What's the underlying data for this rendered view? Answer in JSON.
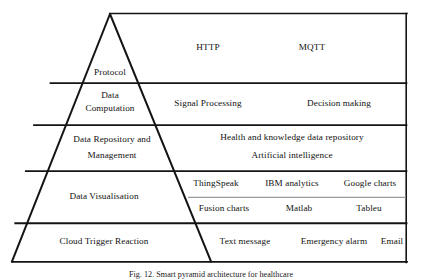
{
  "figure": {
    "caption": "Fig. 12. Smart pyramid architecture for healthcare",
    "colors": {
      "stroke": "#141414",
      "faint_divider": "#8d8d8d",
      "background": "#ffffff",
      "text": "#111111"
    },
    "layers": [
      {
        "id": "protocol",
        "stage": "Protocol",
        "stage_lines": [
          "Protocol"
        ],
        "technologies": [
          "HTTP",
          "MQTT"
        ],
        "tech_rows": [
          [
            "HTTP",
            "MQTT"
          ]
        ]
      },
      {
        "id": "data-computation",
        "stage": "Data Computation",
        "stage_lines": [
          "Data",
          "Computation"
        ],
        "technologies": [
          "Signal Processing",
          "Decision making"
        ],
        "tech_rows": [
          [
            "Signal Processing",
            "Decision making"
          ]
        ]
      },
      {
        "id": "data-repository-and-management",
        "stage": "Data Repository and Management",
        "stage_lines": [
          "Data Repository and",
          "Management"
        ],
        "technologies": [
          "Health and knowledge data repository",
          "Artificial intelligence"
        ],
        "tech_rows": [
          [
            "Health and knowledge data repository"
          ],
          [
            "Artificial intelligence"
          ]
        ]
      },
      {
        "id": "data-visualisation",
        "stage": "Data Visualisation",
        "stage_lines": [
          "Data Visualisation"
        ],
        "technologies": [
          "ThingSpeak",
          "IBM analytics",
          "Google charts",
          "Fusion charts",
          "Matlab",
          "Tableu"
        ],
        "tech_rows": [
          [
            "ThingSpeak",
            "IBM analytics",
            "Google charts"
          ],
          [
            "Fusion charts",
            "Matlab",
            "Tableu"
          ]
        ]
      },
      {
        "id": "cloud-trigger-reaction",
        "stage": "Cloud Trigger Reaction",
        "stage_lines": [
          "Cloud Trigger Reaction"
        ],
        "technologies": [
          "Text message",
          "Emergency alarm",
          "Email"
        ],
        "tech_rows": [
          [
            "Text message",
            "Emergency alarm",
            "Email"
          ]
        ]
      }
    ],
    "labels": {
      "protocol": "Protocol",
      "data_l1": "Data",
      "data_l2": "Computation",
      "repo_l1": "Data Repository and",
      "repo_l2": "Management",
      "visualisation": "Data Visualisation",
      "cloud": "Cloud Trigger Reaction",
      "http": "HTTP",
      "mqtt": "MQTT",
      "signal_processing": "Signal Processing",
      "decision_making": "Decision making",
      "health_repo": "Health and knowledge data repository",
      "artificial_intelligence": "Artificial intelligence",
      "thingspeak": "ThingSpeak",
      "ibm_analytics": "IBM analytics",
      "google_charts": "Google charts",
      "fusion_charts": "Fusion charts",
      "matlab": "Matlab",
      "tableu": "Tableu",
      "text_message": "Text message",
      "emergency_alarm": "Emergency alarm",
      "email": "Email"
    }
  }
}
